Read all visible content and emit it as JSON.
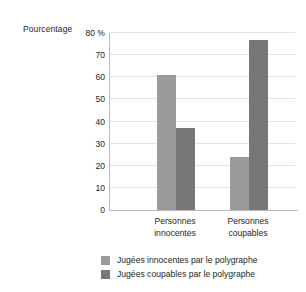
{
  "chart_data": {
    "type": "bar",
    "title": "",
    "ylabel": "Pourcentage",
    "xlabel": "",
    "categories": [
      "Personnes innocentes",
      "Personnes coupables"
    ],
    "category_lines": [
      [
        "Personnes",
        "innocentes"
      ],
      [
        "Personnes",
        "coupables"
      ]
    ],
    "series": [
      {
        "name": "Jugées innocentes par le polygraphe",
        "color": "#9b9b9b",
        "values": [
          61,
          24
        ]
      },
      {
        "name": "Jugées coupables par le polygraphe",
        "color": "#777777",
        "values": [
          37,
          77
        ]
      }
    ],
    "ylim": [
      0,
      80
    ],
    "ytick_values": [
      0,
      10,
      20,
      30,
      40,
      50,
      60,
      70,
      80
    ],
    "ytick_labels": [
      "0",
      "10",
      "20",
      "30",
      "40",
      "50",
      "60",
      "70",
      "80 %"
    ],
    "grid": true,
    "legend_position": "bottom"
  }
}
